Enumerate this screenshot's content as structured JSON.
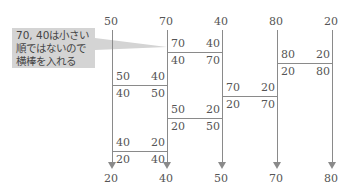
{
  "diagram": {
    "type": "amidakuji-sort",
    "top_values": [
      "50",
      "70",
      "40",
      "80",
      "20"
    ],
    "bottom_values": [
      "20",
      "40",
      "50",
      "70",
      "80"
    ],
    "callout": {
      "lines": [
        "70, 40は小さい",
        "順ではないので",
        "横棒を入れる"
      ]
    },
    "swaps": [
      {
        "left_col": 1,
        "before": [
          "70",
          "40"
        ],
        "after": [
          "40",
          "70"
        ]
      },
      {
        "left_col": 3,
        "before": [
          "80",
          "20"
        ],
        "after": [
          "20",
          "80"
        ]
      },
      {
        "left_col": 0,
        "before": [
          "50",
          "40"
        ],
        "after": [
          "40",
          "50"
        ]
      },
      {
        "left_col": 2,
        "before": [
          "70",
          "20"
        ],
        "after": [
          "20",
          "70"
        ]
      },
      {
        "left_col": 1,
        "before": [
          "50",
          "20"
        ],
        "after": [
          "20",
          "50"
        ]
      },
      {
        "left_col": 0,
        "before": [
          "40",
          "20"
        ],
        "after": [
          "20",
          "40"
        ]
      }
    ]
  }
}
